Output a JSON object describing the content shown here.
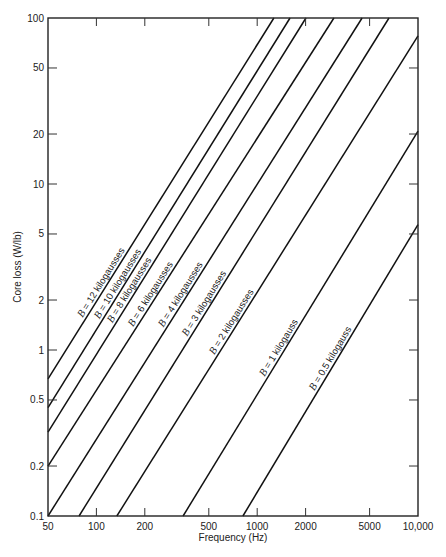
{
  "chart_data": {
    "type": "line",
    "title": "",
    "xlabel": "Frequency (Hz)",
    "ylabel": "Core loss (W/lb)",
    "xscale": "log",
    "yscale": "log",
    "xlim": [
      50,
      10000
    ],
    "ylim": [
      0.1,
      100
    ],
    "grid": false,
    "legend": "inline labels along curves",
    "x_ticks": [
      {
        "value": 50,
        "label": "50"
      },
      {
        "value": 100,
        "label": "100"
      },
      {
        "value": 200,
        "label": "200"
      },
      {
        "value": 500,
        "label": "500"
      },
      {
        "value": 1000,
        "label": "1000"
      },
      {
        "value": 2000,
        "label": "2000"
      },
      {
        "value": 5000,
        "label": "5000"
      },
      {
        "value": 10000,
        "label": "10,000"
      }
    ],
    "y_ticks": [
      {
        "value": 0.1,
        "label": "0.1"
      },
      {
        "value": 0.2,
        "label": "0.2"
      },
      {
        "value": 0.5,
        "label": "0.5"
      },
      {
        "value": 1,
        "label": "1"
      },
      {
        "value": 2,
        "label": "2"
      },
      {
        "value": 5,
        "label": "5"
      },
      {
        "value": 10,
        "label": "10"
      },
      {
        "value": 20,
        "label": "20"
      },
      {
        "value": 50,
        "label": "50"
      },
      {
        "value": 100,
        "label": "100"
      }
    ],
    "series": [
      {
        "name": "B = 12 kilogausses",
        "label": "B = 12 kilogausses",
        "points": [
          [
            50,
            0.67
          ],
          [
            1270,
            100
          ]
        ],
        "label_at": [
          85,
          1.6
        ]
      },
      {
        "name": "B = 10 kilogausses",
        "label": "B = 10 kilogausses",
        "points": [
          [
            50,
            0.45
          ],
          [
            1600,
            100
          ]
        ],
        "label_at": [
          108,
          1.3
        ]
      },
      {
        "name": "B = 8 kilogausses",
        "label": "B = 8 kilogausses",
        "points": [
          [
            50,
            0.32
          ],
          [
            2010,
            100
          ]
        ],
        "label_at": [
          130,
          1.1
        ]
      },
      {
        "name": "B = 6 kilogausses",
        "label": "B = 6 kilogausses",
        "points": [
          [
            50,
            0.2
          ],
          [
            3000,
            100
          ]
        ],
        "label_at": [
          175,
          0.95
        ]
      },
      {
        "name": "B = 4 kilogausses",
        "label": "B = 4 kilogausses",
        "points": [
          [
            50,
            0.1
          ],
          [
            4490,
            100
          ]
        ],
        "label_at": [
          270,
          0.8
        ]
      },
      {
        "name": "B = 3 kilogausses",
        "label": "B = 3 kilogausses",
        "points": [
          [
            78,
            0.1
          ],
          [
            6600,
            100
          ]
        ],
        "label_at": [
          380,
          0.68
        ]
      },
      {
        "name": "B = 2 kilogausses",
        "label": "B = 2 kilogausses",
        "points": [
          [
            134,
            0.1
          ],
          [
            10000,
            78
          ]
        ],
        "label_at": [
          560,
          0.6
        ]
      },
      {
        "name": "B = 1 kilogauss",
        "label": "B = 1 kilogauss",
        "points": [
          [
            346,
            0.1
          ],
          [
            10000,
            20.8
          ]
        ],
        "label_at": [
          1150,
          0.63
        ]
      },
      {
        "name": "B = 0.5 kilogauss",
        "label": "B = 0.5 kilogauss",
        "points": [
          [
            815,
            0.1
          ],
          [
            10000,
            5.7
          ]
        ],
        "label_at": [
          2350,
          0.3
        ]
      }
    ]
  },
  "axes": {
    "x_title": "Frequency (Hz)",
    "y_title": "Core loss (W/lb)"
  }
}
